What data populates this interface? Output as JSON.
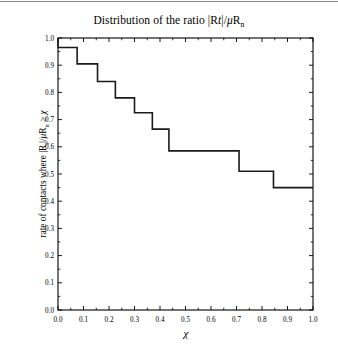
{
  "figure": {
    "title_plain": "Distribution of the ratio |Rt|/μRn",
    "background_color": "#ffffff",
    "line_color": "#1a1a1a",
    "axis_color": "#000000",
    "top_rule_color": "#8a8a8a"
  },
  "chart_data": {
    "type": "line",
    "subtype": "step-post",
    "title": "Distribution of the ratio |Rt|/μRn",
    "xlabel": "χ",
    "ylabel": "rate of contacts where |Rt|/μRn ≥ χ",
    "xlim": [
      0.0,
      1.0
    ],
    "ylim": [
      0.0,
      1.0
    ],
    "grid": false,
    "legend": "none",
    "xticks": [
      "0.0",
      "0.1",
      "0.2",
      "0.3",
      "0.4",
      "0.5",
      "0.6",
      "0.7",
      "0.8",
      "0.9",
      "1.0"
    ],
    "yticks": [
      "0.0",
      "0.1",
      "0.2",
      "0.3",
      "0.4",
      "0.5",
      "0.6",
      "0.7",
      "0.8",
      "0.9",
      "1.0"
    ],
    "xtick_values": [
      0.0,
      0.1,
      0.2,
      0.3,
      0.4,
      0.5,
      0.6,
      0.7,
      0.8,
      0.9,
      1.0
    ],
    "ytick_values": [
      0.0,
      0.1,
      0.2,
      0.3,
      0.4,
      0.5,
      0.6,
      0.7,
      0.8,
      0.9,
      1.0
    ],
    "x": [
      0.0,
      0.0,
      0.075,
      0.155,
      0.225,
      0.3,
      0.37,
      0.435,
      0.71,
      0.845,
      1.0
    ],
    "y": [
      1.0,
      0.965,
      0.905,
      0.84,
      0.78,
      0.725,
      0.665,
      0.585,
      0.51,
      0.45,
      0.45
    ],
    "steps": [
      {
        "x_start": 0.0,
        "x_end": 0.075,
        "value": 0.965
      },
      {
        "x_start": 0.075,
        "x_end": 0.155,
        "value": 0.905
      },
      {
        "x_start": 0.155,
        "x_end": 0.225,
        "value": 0.84
      },
      {
        "x_start": 0.225,
        "x_end": 0.3,
        "value": 0.78
      },
      {
        "x_start": 0.3,
        "x_end": 0.37,
        "value": 0.725
      },
      {
        "x_start": 0.37,
        "x_end": 0.435,
        "value": 0.665
      },
      {
        "x_start": 0.435,
        "x_end": 0.71,
        "value": 0.585
      },
      {
        "x_start": 0.71,
        "x_end": 0.845,
        "value": 0.51
      },
      {
        "x_start": 0.845,
        "x_end": 1.0,
        "value": 0.45
      }
    ]
  }
}
